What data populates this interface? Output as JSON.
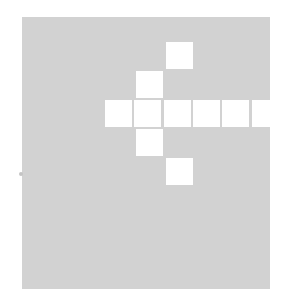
{
  "board": {
    "background": "#d2d2d2",
    "cell_color": "#ffffff",
    "cells": [
      {
        "x": 166,
        "y": 42
      },
      {
        "x": 136,
        "y": 71
      },
      {
        "x": 105,
        "y": 100
      },
      {
        "x": 134,
        "y": 100
      },
      {
        "x": 164,
        "y": 100
      },
      {
        "x": 193,
        "y": 100
      },
      {
        "x": 222,
        "y": 100
      },
      {
        "x": 252,
        "y": 100
      },
      {
        "x": 136,
        "y": 129
      },
      {
        "x": 166,
        "y": 158
      }
    ]
  }
}
